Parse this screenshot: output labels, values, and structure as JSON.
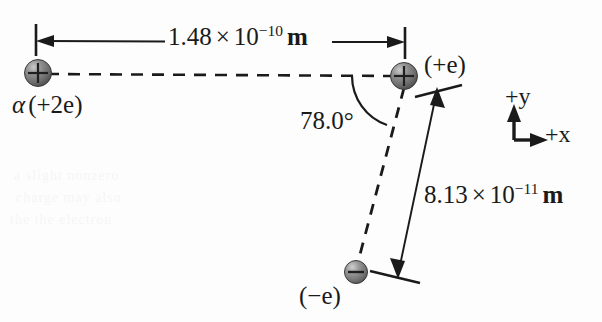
{
  "figure": {
    "background_color": "#fdfdfd",
    "line_color": "#1a1a1a",
    "sphere_fill": "#6e6e6e",
    "sphere_highlight": "#b8b8b8",
    "width": 602,
    "height": 322
  },
  "labels": {
    "distance_top": {
      "mantissa": "1.48",
      "times": "×",
      "base": "10",
      "exponent": "−10",
      "unit": "m",
      "full": "1.48 × 10⁻¹⁰ m"
    },
    "distance_diagonal": {
      "mantissa": "8.13",
      "times": "×",
      "base": "10",
      "exponent": "−11",
      "unit": "m",
      "full": "8.13 × 10⁻¹¹ m"
    },
    "angle": "78.0°",
    "alpha_particle": {
      "symbol": "α",
      "charge": "(+2e)",
      "full": "α (+2e)"
    },
    "proton": {
      "charge": "(+e)"
    },
    "electron": {
      "charge": "(−e)"
    },
    "axis_y": "+y",
    "axis_x": "+x"
  },
  "charges": [
    {
      "name": "alpha-particle",
      "sign": "+",
      "label": "α (+2e)",
      "cx": 38,
      "cy": 73,
      "r": 13
    },
    {
      "name": "proton",
      "sign": "+",
      "label": "(+e)",
      "cx": 404,
      "cy": 76,
      "r": 13
    },
    {
      "name": "electron",
      "sign": "−",
      "label": "(−e)",
      "cx": 356,
      "cy": 272,
      "r": 11
    }
  ],
  "geometry": {
    "separation_horizontal_m": 1.48e-10,
    "separation_diagonal_m": 8.13e-11,
    "angle_degrees": 78.0
  }
}
